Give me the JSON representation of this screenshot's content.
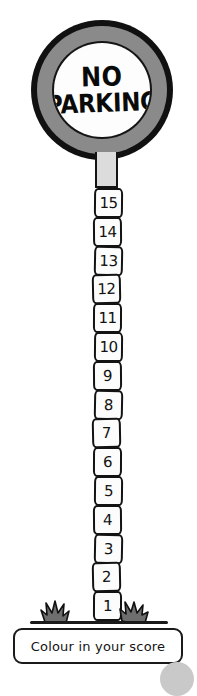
{
  "worksheet": {
    "title_line_1": "NO",
    "title_line_2": "PARKING",
    "caption": "Colour in your score",
    "colors": {
      "ink": "#131313",
      "sign_band_gray": "#8a8a8a",
      "connector_gray": "#dcdcdc",
      "segment_fill": "#fcfcfc",
      "grass_gray": "#6e6e6e",
      "paper": "#ffffff"
    },
    "scale": {
      "max": 15,
      "min": 1,
      "segments": [
        {
          "value": "15"
        },
        {
          "value": "14"
        },
        {
          "value": "13"
        },
        {
          "value": "12"
        },
        {
          "value": "11"
        },
        {
          "value": "10"
        },
        {
          "value": "9"
        },
        {
          "value": "8"
        },
        {
          "value": "7"
        },
        {
          "value": "6"
        },
        {
          "value": "5"
        },
        {
          "value": "4"
        },
        {
          "value": "3"
        },
        {
          "value": "2"
        },
        {
          "value": "1"
        }
      ]
    },
    "icons": {
      "grass_left": "grass-tuft-icon",
      "grass_right": "grass-tuft-icon",
      "sign": "no-parking-sign-icon"
    }
  }
}
